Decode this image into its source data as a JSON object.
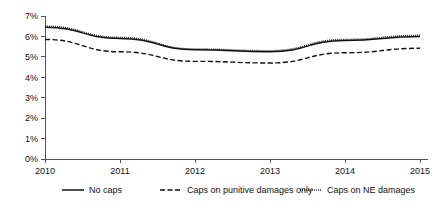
{
  "chart_data": {
    "type": "line",
    "title": "",
    "subtitle": "",
    "xlabel": "",
    "ylabel": "",
    "categories": [
      "2010",
      "2011",
      "2012",
      "2013",
      "2014",
      "2015"
    ],
    "x": [
      2010,
      2011,
      2012,
      2013,
      2014,
      2015
    ],
    "xlim": [
      2010,
      2015
    ],
    "ylim": [
      0,
      7
    ],
    "y_tick_labels": [
      "0%",
      "1%",
      "2%",
      "3%",
      "4%",
      "5%",
      "6%",
      "7%"
    ],
    "y_tick_values": [
      0,
      1,
      2,
      3,
      4,
      5,
      6,
      7
    ],
    "y_unit": "%",
    "grid": false,
    "legend_position": "bottom",
    "series": [
      {
        "name": "No caps",
        "style": "solid",
        "color": "#111111",
        "values": [
          6.45,
          5.9,
          5.35,
          5.25,
          5.8,
          6.0
        ]
      },
      {
        "name": "Caps on punitive damages only",
        "style": "dashed",
        "color": "#111111",
        "values": [
          5.85,
          5.25,
          4.78,
          4.7,
          5.2,
          5.42
        ]
      },
      {
        "name": "Caps on NE damages",
        "style": "dotted",
        "color": "#111111",
        "values": [
          6.5,
          5.95,
          5.38,
          5.3,
          5.85,
          6.05
        ]
      }
    ]
  },
  "axes": {
    "y_ticks": [
      {
        "label": "7%",
        "value": 7
      },
      {
        "label": "6%",
        "value": 6
      },
      {
        "label": "5%",
        "value": 5
      },
      {
        "label": "4%",
        "value": 4
      },
      {
        "label": "3%",
        "value": 3
      },
      {
        "label": "2%",
        "value": 2
      },
      {
        "label": "1%",
        "value": 1
      },
      {
        "label": "0%",
        "value": 0
      }
    ],
    "x_ticks": [
      {
        "label": "2010",
        "value": 2010
      },
      {
        "label": "2011",
        "value": 2011
      },
      {
        "label": "2012",
        "value": 2012
      },
      {
        "label": "2013",
        "value": 2013
      },
      {
        "label": "2014",
        "value": 2014
      },
      {
        "label": "2015",
        "value": 2015
      }
    ]
  },
  "legend": {
    "items": [
      {
        "label": "No caps",
        "style": "solid"
      },
      {
        "label": "Caps on punitive damages only",
        "style": "dashed"
      },
      {
        "label": "Caps on NE damages",
        "style": "dotted"
      }
    ]
  }
}
